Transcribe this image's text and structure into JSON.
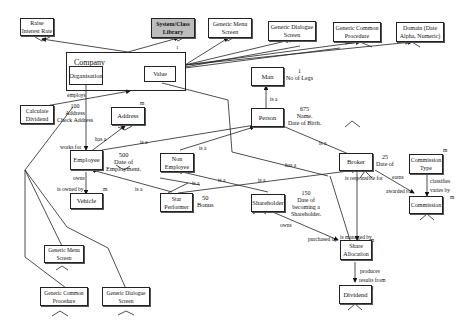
{
  "diagram": {
    "type": "entity-relationship / object model",
    "top_row": [
      {
        "id": "raise-interest-rate",
        "label": "Raise Interest Rate"
      },
      {
        "id": "system-class-library",
        "label": "System/Class Library",
        "highlighted": true,
        "fill": "#bdbdbd"
      },
      {
        "id": "generic-menu-screen-top",
        "label": "Generic Menu Screen"
      },
      {
        "id": "generic-dialogue-screen-top",
        "label": "Generic Dialogue Screen"
      },
      {
        "id": "generic-common-procedure-top",
        "label": "Generic Common Procedure"
      },
      {
        "id": "domain",
        "label": "Domain (Date Alpha, Numeric)"
      }
    ],
    "company": {
      "title": "Company",
      "organisation": "Organisation",
      "value": "Value",
      "cardinality_top": "1"
    },
    "entities": {
      "calculate_dividend": "Calculate Dividend",
      "address": "Address",
      "employee": "Employee",
      "non_employee": "Non Employee",
      "vehicle": "Vehicle",
      "star_performer": "Star Performer",
      "shareholder": "Shareholder",
      "man": "Man",
      "person": "Person",
      "broker": "Broker",
      "commission_type": "Commission Type",
      "commission": "Commission",
      "share_allocation": "Share Allocation",
      "dividend": "Dividend",
      "generic_menu_screen_bottom": "Generic Menu Screen",
      "generic_common_procedure_bottom": "Generic Common Procedure",
      "generic_dialogue_screen_bottom": "Generic Dialogue Screen"
    },
    "notes": {
      "employee_count_addr": "100\nAddress\nCheck Address",
      "man": "1\nNo of Legs",
      "person": "675\nName.\nDate of Birth.",
      "employee": "500\nDate of\nEmployment.",
      "broker": "25\nDate of",
      "shareholder": "150\nDate of\nbecoming a\nShareholder.",
      "star_performer": "50\nBonus"
    },
    "relationship_labels": {
      "employs": "employs",
      "works_for": "works for",
      "has_a_addr": "has a",
      "owns_emp": "owns",
      "is_owned_by": "is owned by",
      "m_vehicle": "m",
      "m_address": "m",
      "is_a_emp_person": "is a",
      "is_a_man": "is a",
      "is_a_star": "is a",
      "is_a_non": "is a",
      "is_a_share1": "is a",
      "is_a_share2": "is a",
      "is_a_broker": "is a",
      "has_a_broker": "has a",
      "is_responsible_for": "is responsible for",
      "earns": "earns",
      "awarded_to": "awarded to",
      "classifies": "classifies",
      "varies_by": "varies by",
      "m_commission": "m",
      "m_commtype": "m",
      "owns_share": "owns",
      "purchased_by": "purchased by",
      "is_managed_by": "is managed by",
      "m_share": "m",
      "produces": "produces",
      "results_from": "results from",
      "m_dividend": "m"
    }
  }
}
